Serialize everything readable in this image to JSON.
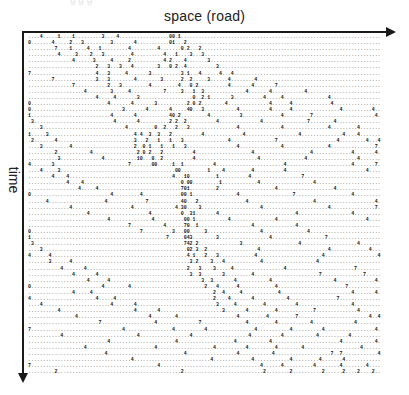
{
  "diagram": {
    "x_axis_label": "space (road)",
    "y_axis_label": "time",
    "ghost_text": "g                  g                          g",
    "rows": [
      "....4.....1....1.........3....4.................00.1...................................................................",
      "0.......4.....2...3.........3.......4...........01...2.................................................................",
      ".........7....1.....4...1.........4.........4.......0.2...2............................................................",
      "..........4.....3....2...3.........4..........4...1....3...3...........................................................",
      "...............4......3.....4.....2...........4.2....4.......3..........................................................",
      ".......................2...3...3...4........3...0.2..4..........3.......................................................",
      "7......................4...3.....4.......3..........3.1...4......4...4..................................................",
      "........7..............3...3........4........3......2..2.....3......4........4..........................................",
      "...............7...........2...3.........4.........4...0.2..........4.......4.......7..................................",
      "...................4........3.....4...........7.....3...1..3..............4.......4...........4........................",
      ".......................4.....4.......3..................0..2.1.......3..........4.....4...............4.................",
      "0..........................4.......4.......3..........2.0.2........4..............4......4.............4...............",
      "0...............................3.......4.......4.....40...3...........4..........4......4................4..........4..",
      "1...........................4.......4...........40.2.........4..........3.............4.........7.....................4",
      ".3...........................4.......4..........2.2..2..........4..............4...............7........4..............",
      "....3............................4.........0..2...2...3................4..............4...............4.........4.......",
      "1.....3.............................4.4..3..3...2..........4.............4..................4..............4....4.......",
      ".2.......4..........................3...2...1...1...3...............4...............7....................4.........4...4",
      "....3.........4.....................2..0.1...1...1...3.................4..............4...............4...............7.",
      ".........2...........4...............2.0.2...2..........4...................4...................4.............4.......4",
      "..........3..............4...........10...0..2..........4.....................4...............4.................4......",
      "4.......3.........................7.......00.....1..1..........4.......................4......................4.......7",
      "....4.....3.......................................00.........1....4.........4..........4...........................4....",
      "........4....4...................................4...10.........1..........4.................7..........................4",
      ".............4....4.................................0.00.........1............4..................4......................",
      ".................4.....4............................701.........2...................4...................4...............",
      "0...........................4.........4.............00.1...............4..................7...................4........",
      "......4...................4.............7...........40...2................4......................4....................4.",
      "..............4....................4..............4.30....3....................4......................4...............7.",
      "....................4....................4..........0..31.......4..........................4..................4.........",
      "...........................4..............4..........00.1...........4...............4..............................4..",
      "..................................7...........4......70..1..................4..............4............................",
      "0.....................................7..........3...00.....3..................4...............4........................",
      "1..............................................7.....043........3.................4..................7..................",
      ".3...................................................742.2..............3...................4...................4.......",
      "....3.................................................02.3..2.................4.......................4.............4...",
      "4......4..............................................4.1...2...3............4......................4..................4",
      ".......3......4........................................3.2....3...4............4..................4.....................",
      "...........4.......4..................................2...3....3.....4.................4.......................7........",
      "...............4.......4...............................3..3.......3.........4......................7..............7.....",
      "....................4......4...............................3..3.......4...........4.....................4.............4",
      "0........................4........4.........................2...4......4............4.......................7..........",
      "...............4.....4.........................................2..4.....4............4........................4.......4",
      "4......................4.....4.................................2....4.......4...........4................7.............",
      "....4.......................4.......4...........................3.....4.........4..........4..................4........",
      "..........4.........................4.......4.....................3.......4.........4............7..............4.....",
      "................4........................4........4....................4.........4.........7........................4..4",
      "........................7..................4..............7...............4.........4...........4..............4.......",
      "7...............................4................4..........4................4...........4..........4.................4.",
      "...........4.........................4.................4...................4..........4...........4..........4...........",
      "...........................4......................4...................4...........4.......................4...........4",
      "...................4.......................4...................4..........4.........4........4...................4......",
      "..........................4..........................4.................4...........4...................7..7............4",
      "...................................4..........................4.............4............4.........4.......4...........",
      "7...........................................4..................................4......4..........4........4........4.....",
      ".........2..........................................2...........................2........2..........2......2....2....2.."
    ]
  }
}
